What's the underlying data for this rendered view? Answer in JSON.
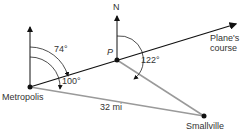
{
  "diagram": {
    "points": {
      "metropolis": {
        "label": "Metropolis",
        "x": 30,
        "y": 87
      },
      "p": {
        "label": "P",
        "x": 117,
        "y": 60
      },
      "smallville": {
        "label": "Smallville",
        "x": 204,
        "y": 116
      }
    },
    "north_label": "N",
    "course_label_line1": "Plane's",
    "course_label_line2": "course",
    "distance_label": "32 mi",
    "angles": {
      "a74": "74°",
      "a100": "100°",
      "a122": "122°"
    },
    "colors": {
      "line_dark": "#111111",
      "line_gray": "#9a9a9a",
      "arc": "#222222",
      "text": "#333333"
    }
  }
}
